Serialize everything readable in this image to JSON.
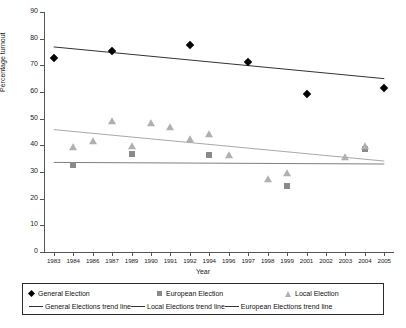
{
  "chart_data": {
    "type": "scatter",
    "title": "",
    "xlabel": "Year",
    "ylabel": "Percentage turnout",
    "xlim": [
      1983,
      2005
    ],
    "ylim": [
      0,
      90
    ],
    "ytick_step": 10,
    "grid": false,
    "legend_position": "bottom",
    "yticks": [
      "0",
      "10",
      "20",
      "30",
      "40",
      "50",
      "60",
      "70",
      "80",
      "90"
    ],
    "xticks": [
      "1983",
      "1984",
      "1986",
      "1987",
      "1989",
      "1990",
      "1991",
      "1992",
      "1994",
      "1996",
      "1997",
      "1998",
      "1999",
      "2001",
      "2002",
      "2003",
      "2004",
      "2005"
    ],
    "series": [
      {
        "name": "General Election",
        "marker": "diamond",
        "color": "#000000",
        "points": [
          {
            "x": 1983,
            "y": 72.7
          },
          {
            "x": 1987,
            "y": 75.3
          },
          {
            "x": 1992,
            "y": 77.7
          },
          {
            "x": 1997,
            "y": 71.4
          },
          {
            "x": 2001,
            "y": 59.4
          },
          {
            "x": 2005,
            "y": 61.4
          }
        ]
      },
      {
        "name": "European Election",
        "marker": "square",
        "color": "#8a8a8a",
        "points": [
          {
            "x": 1984,
            "y": 32.6
          },
          {
            "x": 1989,
            "y": 36.8
          },
          {
            "x": 1994,
            "y": 36.4
          },
          {
            "x": 1999,
            "y": 24.6
          },
          {
            "x": 2004,
            "y": 38.5
          }
        ]
      },
      {
        "name": "Local Election",
        "marker": "triangle",
        "color": "#b0b0b0",
        "points": [
          {
            "x": 1984,
            "y": 39.5
          },
          {
            "x": 1986,
            "y": 41.6
          },
          {
            "x": 1987,
            "y": 49.0
          },
          {
            "x": 1989,
            "y": 39.6
          },
          {
            "x": 1990,
            "y": 48.4
          },
          {
            "x": 1991,
            "y": 47.0
          },
          {
            "x": 1992,
            "y": 42.4
          },
          {
            "x": 1994,
            "y": 44.1
          },
          {
            "x": 1996,
            "y": 36.5
          },
          {
            "x": 1998,
            "y": 27.5
          },
          {
            "x": 1999,
            "y": 29.7
          },
          {
            "x": 2003,
            "y": 35.8
          },
          {
            "x": 2004,
            "y": 39.9
          }
        ]
      }
    ],
    "trend_lines": [
      {
        "name": "General Elections trend line",
        "color": "#333333",
        "x0": 1983,
        "y0": 76.9,
        "x1": 2005,
        "y1": 65.0
      },
      {
        "name": "Local Elections trend line",
        "color": "#a8a8a8",
        "x0": 1983,
        "y0": 45.9,
        "x1": 2005,
        "y1": 34.1
      },
      {
        "name": "European Elections trend line",
        "color": "#808080",
        "x0": 1983,
        "y0": 33.6,
        "x1": 2005,
        "y1": 33.0
      }
    ]
  },
  "legend": {
    "markers": [
      {
        "label": "General Election",
        "icon": "diamond-marker-icon"
      },
      {
        "label": "European Election",
        "icon": "square-marker-icon"
      },
      {
        "label": "Local Election",
        "icon": "triangle-marker-icon"
      }
    ],
    "lines": [
      {
        "label": "General Elections trend line",
        "icon": "line-swatch-icon"
      },
      {
        "label": "Local Elections trend line",
        "icon": "line-swatch-icon"
      },
      {
        "label": "European Elections trend line",
        "icon": "line-swatch-icon"
      }
    ]
  }
}
